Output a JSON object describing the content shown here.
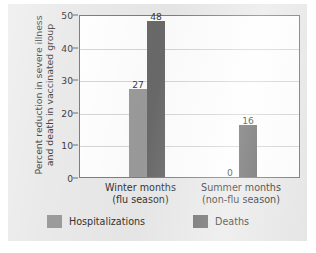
{
  "chart_data": {
    "type": "bar",
    "title": "",
    "subtitle": "",
    "xlabel": "",
    "ylabel": "Percent reduction in severe illness and death in vaccinated group",
    "ylabel_lines": [
      "Percent reduction in severe illness",
      "and death in vaccinated group"
    ],
    "categories": [
      "Winter months (flu season)",
      "Summer months (non-flu season)"
    ],
    "category_lines": [
      [
        "Winter months",
        "(flu season)"
      ],
      [
        "Summer months",
        "(non-flu season)"
      ]
    ],
    "series": [
      {
        "name": "Hospitalizations",
        "values": [
          27,
          0
        ],
        "color": "#9b9b9b"
      },
      {
        "name": "Deaths",
        "values": [
          48,
          16
        ],
        "color": "#6a6a6a"
      }
    ],
    "data_labels": [
      "27",
      "48",
      "0",
      "16"
    ],
    "ylim": [
      0,
      50
    ],
    "yticks": [
      0,
      10,
      20,
      30,
      40,
      50
    ],
    "ytick_labels": [
      "0",
      "10",
      "20",
      "30",
      "40",
      "50"
    ],
    "grid": "horizontal",
    "legend_position": "bottom"
  },
  "figure": {
    "background_color": "#e9e9e9",
    "plot_background_color": "#fefefe",
    "frame_color": "#7e7e7e",
    "gridline_color": "#d5d5d5",
    "text_color": "#333333"
  },
  "legend": {
    "entries": [
      {
        "label": "Hospitalizations",
        "color": "#9b9b9b"
      },
      {
        "label": "Deaths",
        "color": "#6a6a6a"
      }
    ]
  }
}
